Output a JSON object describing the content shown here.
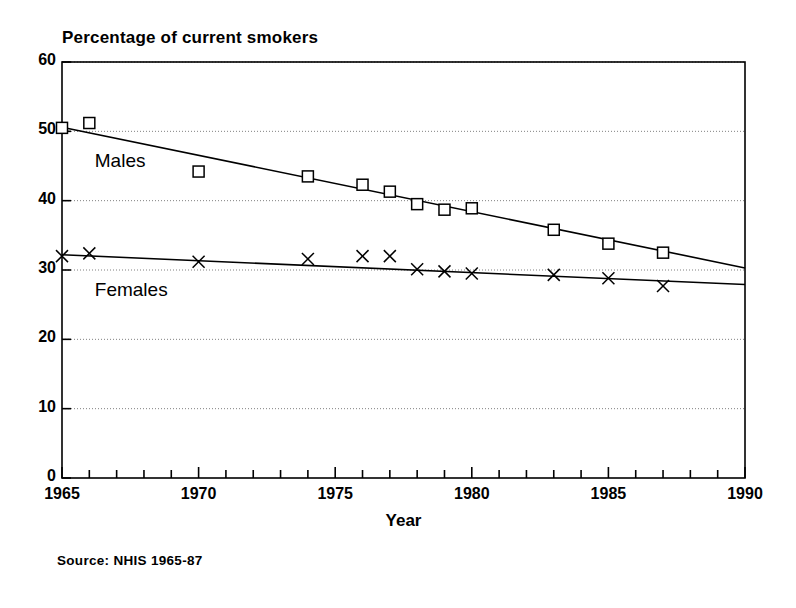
{
  "chart_data": {
    "type": "line",
    "title": "Percentage of current smokers",
    "xlabel": "Year",
    "ylabel": "",
    "source": "Source: NHIS 1965-87",
    "xlim": [
      1965,
      1990
    ],
    "ylim": [
      0,
      60
    ],
    "ytick_values": [
      0,
      10,
      20,
      30,
      40,
      50,
      60
    ],
    "ytick_labels": [
      "0",
      "10",
      "20",
      "30",
      "40",
      "50",
      "60"
    ],
    "xtick_values": [
      1965,
      1970,
      1975,
      1980,
      1985,
      1990
    ],
    "xtick_labels": [
      "1965",
      "1970",
      "1975",
      "1980",
      "1985",
      "1990"
    ],
    "x_minor_tick_step": 1,
    "grid": "horizontal-dotted",
    "legend": "inline-annotations",
    "series": [
      {
        "name": "Males",
        "marker": "open-square",
        "annotation": "Males",
        "x": [
          1965,
          1966,
          1970,
          1974,
          1976,
          1977,
          1978,
          1979,
          1980,
          1983,
          1985,
          1987
        ],
        "values": [
          50.5,
          51.2,
          44.2,
          43.5,
          42.3,
          41.3,
          39.5,
          38.7,
          38.9,
          35.8,
          33.8,
          32.5
        ],
        "trendline": {
          "x": [
            1965,
            1990
          ],
          "y": [
            50.6,
            30.3
          ]
        }
      },
      {
        "name": "Females",
        "marker": "x-cross",
        "annotation": "Females",
        "x": [
          1965,
          1966,
          1970,
          1974,
          1976,
          1977,
          1978,
          1979,
          1980,
          1983,
          1985,
          1987
        ],
        "values": [
          32.0,
          32.4,
          31.2,
          31.6,
          32.0,
          32.0,
          30.1,
          29.8,
          29.5,
          29.3,
          28.8,
          27.7
        ],
        "trendline": {
          "x": [
            1965,
            1990
          ],
          "y": [
            32.2,
            27.9
          ]
        }
      }
    ],
    "annotations": [
      {
        "text": "Males",
        "x": 1966.2,
        "y": 45.5
      },
      {
        "text": "Females",
        "x": 1966.2,
        "y": 26.8
      }
    ],
    "colors": {
      "axis": "#000000",
      "series_males": "#000000",
      "series_females": "#000000",
      "grid": "#808080",
      "background": "#ffffff"
    }
  }
}
